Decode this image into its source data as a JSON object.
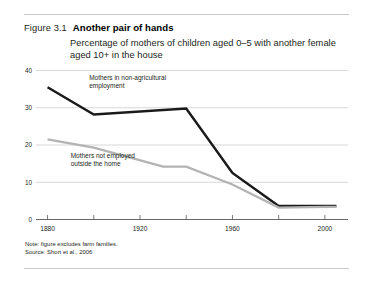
{
  "figure": {
    "number": "Figure 3.1",
    "title": "Another pair of hands",
    "subtitle": "Percentage of mothers of children aged 0–5 with another female aged 10+ in the house",
    "note": "Note: figure excludes farm families.",
    "source": "Source: Short et al., 2006"
  },
  "colors": {
    "series_black": "#1a1a1a",
    "series_gray": "#b3b3b3",
    "gridline": "#c6c6c6",
    "axis": "#5a5a5a",
    "text": "#231f20"
  },
  "chart_data": {
    "type": "line",
    "title": "Another pair of hands",
    "subtitle": "Percentage of mothers of children aged 0–5 with another female aged 10+ in the house",
    "xlabel": "",
    "ylabel": "",
    "xlim": [
      1875,
      2010
    ],
    "ylim": [
      0,
      40
    ],
    "yticks": [
      0,
      10,
      20,
      30,
      40
    ],
    "ytick_labels": [
      "0",
      "10",
      "20",
      "30",
      "40"
    ],
    "xticks": [
      1880,
      1900,
      1920,
      1940,
      1960,
      1980,
      2000
    ],
    "xtick_labels": [
      "1880",
      "",
      "1920",
      "",
      "1960",
      "",
      "2000"
    ],
    "xtick_labels_shown": [
      "1880",
      "1920",
      "1960",
      "2000"
    ],
    "grid": "horizontal",
    "legend": "inline-annotations",
    "series": [
      {
        "name": "Mothers in non-agricultural employment",
        "color": "#1a1a1a",
        "x": [
          1880,
          1900,
          1940,
          1960,
          1980,
          2000,
          2005
        ],
        "values": [
          35.5,
          28.2,
          29.8,
          12.5,
          3.6,
          3.6,
          3.6
        ]
      },
      {
        "name": "Mothers not employed outside the home",
        "color": "#b3b3b3",
        "x": [
          1880,
          1900,
          1930,
          1940,
          1960,
          1980,
          2000,
          2005
        ],
        "values": [
          21.5,
          19.3,
          14.2,
          14.2,
          9.4,
          3.2,
          3.4,
          3.4
        ]
      }
    ],
    "annotations": [
      {
        "text_lines": [
          "Mothers in non-agricultural",
          "employment"
        ],
        "x": 1898,
        "y": 37.5
      },
      {
        "text_lines": [
          "Mothers not employed",
          "outside the home"
        ],
        "x": 1890,
        "y": 16.5
      }
    ]
  }
}
